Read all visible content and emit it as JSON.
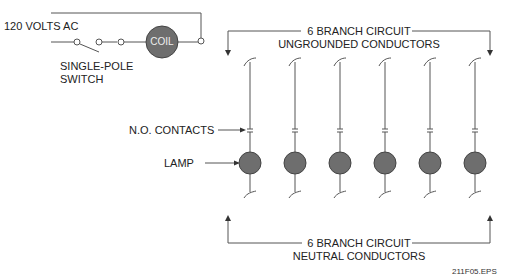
{
  "diagram": {
    "source_label": "120 VOLTS AC",
    "switch_label": [
      "SINGLE-POLE",
      "SWITCH"
    ],
    "coil_label": "COIL",
    "contacts_label": "N.O. CONTACTS",
    "lamp_label": "LAMP",
    "top_bracket": [
      "6 BRANCH CIRCUIT",
      "UNGROUNDED CONDUCTORS"
    ],
    "bottom_bracket": [
      "6 BRANCH CIRCUIT",
      "NEUTRAL CONDUCTORS"
    ],
    "figure_id": "211F05.EPS",
    "branch_count": 6,
    "colors": {
      "lamp_fill": "#6e6e6e",
      "line": "#555555",
      "coil_fill": "#6e6e6e"
    }
  }
}
